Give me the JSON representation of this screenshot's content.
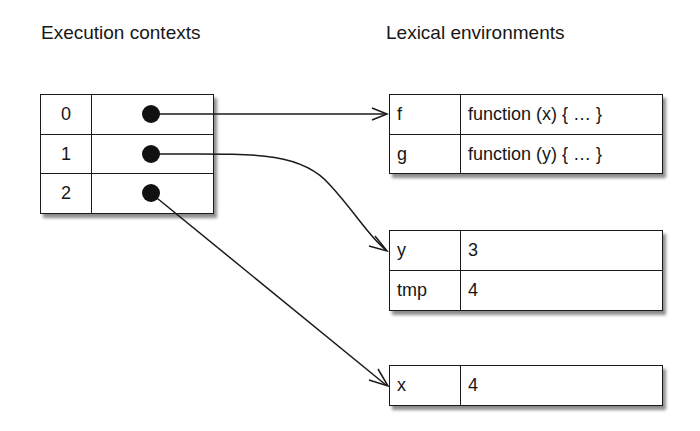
{
  "headings": {
    "left": "Execution contexts",
    "right": "Lexical environments"
  },
  "execution_contexts": [
    {
      "index": "0",
      "points_to": "env_fg"
    },
    {
      "index": "1",
      "points_to": "env_y_tmp"
    },
    {
      "index": "2",
      "points_to": "env_x"
    }
  ],
  "lexical_environments": {
    "env_fg": [
      {
        "name": "f",
        "value": "function (x) { … }"
      },
      {
        "name": "g",
        "value": "function (y) { … }"
      }
    ],
    "env_y_tmp": [
      {
        "name": "y",
        "value": "3"
      },
      {
        "name": "tmp",
        "value": "4"
      }
    ],
    "env_x": [
      {
        "name": "x",
        "value": "4"
      }
    ]
  },
  "colors": {
    "line": "#1a1a1a",
    "background": "#ffffff"
  }
}
